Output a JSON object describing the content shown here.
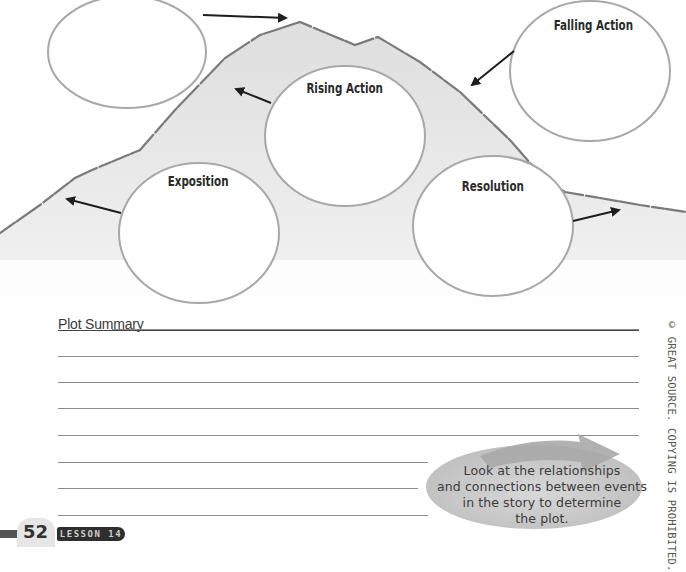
{
  "diagram": {
    "circles": [
      {
        "id": "climax",
        "label": ""
      },
      {
        "id": "rising_action",
        "label": "Rising Action"
      },
      {
        "id": "falling_action",
        "label": "Falling Action"
      },
      {
        "id": "exposition",
        "label": "Exposition"
      },
      {
        "id": "resolution",
        "label": "Resolution"
      }
    ],
    "colors": {
      "mountain_fill": "#e9e9e9",
      "mountain_edge": "#7a7a7a",
      "circle_stroke": "#a8a8a8",
      "arrow": "#1e1e1e"
    }
  },
  "summary": {
    "title": "Plot Summary",
    "line_count": 8
  },
  "callout": {
    "text_lines": [
      "Look at the relationships",
      "and connections between events",
      "in the story to determine",
      "the plot."
    ],
    "color": "#c9c9c9"
  },
  "copyright": "© GREAT SOURCE. COPYING IS PROHIBITED.",
  "footer": {
    "page_number": "52",
    "lesson_label": "LESSON 14"
  }
}
